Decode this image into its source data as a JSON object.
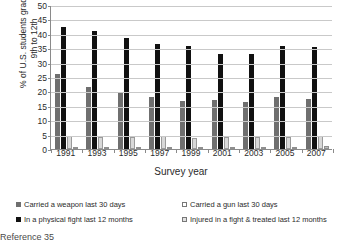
{
  "chart_data": {
    "type": "bar",
    "title": "",
    "xlabel": "Survey year",
    "ylabel": "% of U.S. students grades\n9th to 12th",
    "categories": [
      "1991",
      "1993",
      "1995",
      "1997",
      "1999",
      "2001",
      "2003",
      "2005",
      "2007"
    ],
    "ylim": [
      0,
      50
    ],
    "yticks": [
      "0",
      "5",
      "10",
      "15",
      "20",
      "25",
      "30",
      "35",
      "40",
      "45",
      "50"
    ],
    "grid": true,
    "legend_position": "bottom",
    "series": [
      {
        "name": "Carried a weapon last 30 days",
        "color": "#6f6f6f",
        "values": [
          26.1,
          21.7,
          19.8,
          17.9,
          16.8,
          17.0,
          16.4,
          18.0,
          17.2
        ]
      },
      {
        "name": "In a physical fight last 12 months",
        "color": "#111111",
        "values": [
          42.5,
          41.1,
          38.7,
          36.6,
          35.7,
          33.0,
          33.0,
          35.9,
          35.5
        ]
      },
      {
        "name": "Carried a gun last 30 days",
        "color": "#d8d8d8",
        "values": [
          4.6,
          4.2,
          4.1,
          4.4,
          3.7,
          4.1,
          4.0,
          4.3,
          4.4
        ]
      },
      {
        "name": "Injured in a fight & treated last 12 months",
        "color": "#bdbdbd",
        "values": [
          0.6,
          0.7,
          0.7,
          0.8,
          0.7,
          0.8,
          0.8,
          0.8,
          0.9
        ]
      }
    ]
  },
  "legend": {
    "items": [
      {
        "label": "Carried a weapon last 30 days"
      },
      {
        "label": "Carried a gun last 30 days"
      },
      {
        "label": "In a physical fight last 12 months"
      },
      {
        "label": "Injured in a fight & treated last 12 months"
      }
    ]
  },
  "footer": {
    "reference": "Reference 35"
  }
}
